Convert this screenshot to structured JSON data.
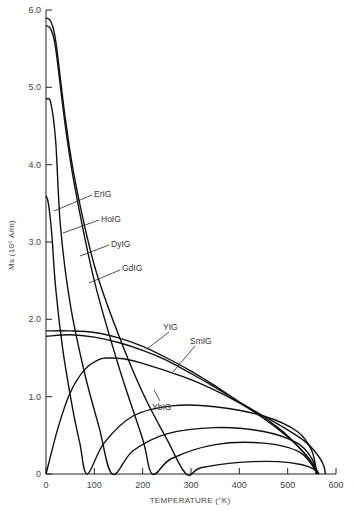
{
  "chart_data": {
    "type": "line",
    "title": "",
    "xlabel": "TEMPERATURE (°K)",
    "ylabel": "Ms (10⁵ A/m)",
    "xlim": [
      0,
      600
    ],
    "ylim": [
      0,
      6.0
    ],
    "xticks": [
      "0",
      "100",
      "200",
      "300",
      "400",
      "500",
      "600"
    ],
    "yticks": [
      "0",
      "1.0",
      "2.0",
      "3.0",
      "4.0",
      "5.0",
      "6.0"
    ],
    "grid": false,
    "legend": "inline labels with leader lines",
    "series": [
      {
        "name": "GdIG",
        "x": [
          0,
          10,
          20,
          40,
          60,
          100,
          150,
          200,
          250,
          290,
          320,
          400,
          480,
          530,
          555,
          564
        ],
        "y": [
          5.9,
          5.85,
          5.6,
          4.6,
          3.8,
          2.7,
          1.8,
          1.05,
          0.45,
          0.0,
          0.08,
          0.15,
          0.16,
          0.12,
          0.06,
          0.0
        ]
      },
      {
        "name": "DyIG",
        "x": [
          0,
          10,
          20,
          40,
          60,
          100,
          150,
          200,
          220,
          260,
          350,
          450,
          520,
          550,
          560
        ],
        "y": [
          5.8,
          5.75,
          5.5,
          4.5,
          3.7,
          2.5,
          1.4,
          0.45,
          0.0,
          0.2,
          0.38,
          0.4,
          0.3,
          0.12,
          0.0
        ]
      },
      {
        "name": "HoIG",
        "x": [
          0,
          10,
          20,
          30,
          50,
          80,
          110,
          137,
          180,
          250,
          350,
          450,
          520,
          550,
          562
        ],
        "y": [
          4.85,
          4.8,
          4.3,
          3.2,
          2.2,
          1.3,
          0.6,
          0.0,
          0.3,
          0.52,
          0.6,
          0.55,
          0.4,
          0.2,
          0.0
        ]
      },
      {
        "name": "ErIG",
        "x": [
          0,
          5,
          12,
          20,
          35,
          55,
          70,
          85,
          120,
          180,
          260,
          350,
          450,
          520,
          550,
          560
        ],
        "y": [
          3.6,
          3.5,
          3.1,
          2.4,
          1.6,
          0.85,
          0.4,
          0.0,
          0.4,
          0.75,
          0.88,
          0.87,
          0.75,
          0.55,
          0.3,
          0.0
        ]
      },
      {
        "name": "YbIG",
        "x": [
          0,
          25,
          50,
          80,
          110,
          130,
          160,
          200,
          300,
          400,
          480,
          530,
          555,
          565
        ],
        "y": [
          0.0,
          0.6,
          1.05,
          1.35,
          1.48,
          1.5,
          1.49,
          1.43,
          1.22,
          0.92,
          0.6,
          0.3,
          0.1,
          0.0
        ]
      },
      {
        "name": "YIG",
        "x": [
          0,
          50,
          100,
          150,
          200,
          250,
          300,
          350,
          400,
          450,
          500,
          530,
          550,
          560
        ],
        "y": [
          1.85,
          1.85,
          1.83,
          1.76,
          1.65,
          1.5,
          1.33,
          1.14,
          0.93,
          0.72,
          0.48,
          0.3,
          0.15,
          0.0
        ]
      },
      {
        "name": "SmIG",
        "x": [
          0,
          50,
          100,
          150,
          200,
          250,
          300,
          350,
          400,
          450,
          500,
          540,
          565,
          575,
          578
        ],
        "y": [
          1.78,
          1.8,
          1.77,
          1.7,
          1.6,
          1.47,
          1.3,
          1.12,
          0.93,
          0.75,
          0.57,
          0.4,
          0.22,
          0.1,
          0.0
        ]
      }
    ],
    "annotations": [
      {
        "text": "ErIG",
        "at": [
          80,
          3.55
        ]
      },
      {
        "text": "HoIG",
        "at": [
          106,
          3.25
        ]
      },
      {
        "text": "DyIG",
        "at": [
          126,
          2.97
        ]
      },
      {
        "text": "GdIG",
        "at": [
          140,
          2.72
        ]
      },
      {
        "text": "YIG",
        "at": [
          243,
          2.0
        ]
      },
      {
        "text": "SmIG",
        "at": [
          310,
          1.78
        ]
      },
      {
        "text": "YbIG",
        "at": [
          225,
          1.47
        ]
      }
    ]
  },
  "axis": {
    "x_title": "TEMPERATURE (°K)",
    "y_title": "Ms (10⁵ A/m)"
  }
}
